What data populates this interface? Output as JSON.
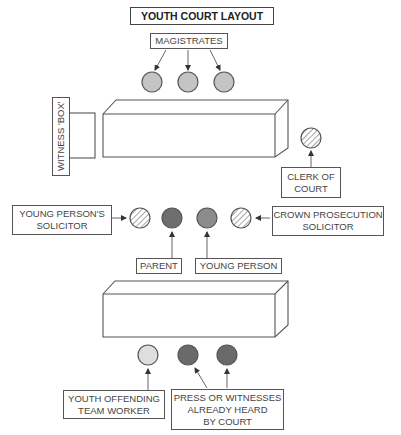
{
  "diagram": {
    "title": "YOUTH COURT LAYOUT",
    "labels": {
      "magistrates": "MAGISTRATES",
      "witness_box": "WITNESS 'BOX'",
      "clerk": "CLERK OF\nCOURT",
      "yp_solicitor": "YOUNG PERSON'S\nSOLICITOR",
      "cps": "CROWN PROSECUTION\nSOLICITOR",
      "parent": "PARENT",
      "young_person": "YOUNG PERSON",
      "yot_worker": "YOUTH OFFENDING\nTEAM WORKER",
      "press": "PRESS OR WITNESSES\nALREADY HEARD\nBY COURT"
    },
    "colors": {
      "magistrate_fill": "#c4c4c4",
      "parent_fill": "#6e6e6e",
      "young_person_fill": "#8c8c8c",
      "yot_fill": "#dedede",
      "press_fill": "#6a6a6a",
      "stroke": "#555555"
    }
  }
}
